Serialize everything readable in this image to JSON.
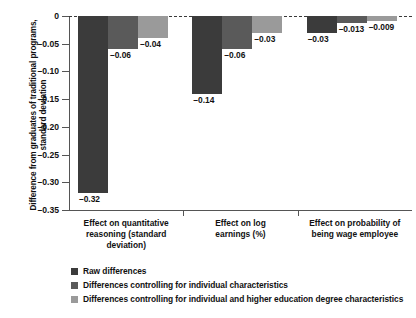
{
  "chart_data": {
    "type": "bar",
    "title": "",
    "xlabel": "",
    "ylabel": "Difference from graduates of traditional programs, standard deviation",
    "ylabel_line1": "Difference from graduates of traditional programs,",
    "ylabel_line2": "standard deviation",
    "ylim": [
      -0.35,
      0
    ],
    "grid": false,
    "legend_position": "bottom-left",
    "y_ticks": [
      "0",
      "–0.05",
      "–0.10",
      "–0.15",
      "–0.20",
      "–0.25",
      "–0.30",
      "–0.35"
    ],
    "y_tick_values": [
      0,
      -0.05,
      -0.1,
      -0.15,
      -0.2,
      -0.25,
      -0.3,
      -0.35
    ],
    "categories": [
      "Effect on quantitative reasoning (standard deviation)",
      "Effect on log earnings (%)",
      "Effect on probability of being wage employee"
    ],
    "category_lines": [
      [
        "Effect on quantitative",
        "reasoning (standard",
        "deviation)"
      ],
      [
        "Effect on log",
        "earnings (%)"
      ],
      [
        "Effect on probability of",
        "being wage employee"
      ]
    ],
    "series": [
      {
        "name": "Raw differences",
        "color": "#3b3b3b",
        "values": [
          -0.32,
          -0.14,
          -0.03
        ],
        "labels": [
          "–0.32",
          "–0.14",
          "–0.03"
        ]
      },
      {
        "name": "Differences controlling for individual characteristics",
        "color": "#5a5a5a",
        "values": [
          -0.06,
          -0.06,
          -0.013
        ],
        "labels": [
          "–0.06",
          "–0.06",
          "–0.013"
        ]
      },
      {
        "name": "Differences controlling for individual and higher education degree characteristics",
        "color": "#9a9a9a",
        "values": [
          -0.04,
          -0.03,
          -0.009
        ],
        "labels": [
          "–0.04",
          "–0.03",
          "–0.009"
        ]
      }
    ]
  },
  "legend": {
    "items": [
      {
        "label": "Raw differences",
        "color": "#3b3b3b"
      },
      {
        "label": "Differences controlling for individual characteristics",
        "color": "#5a5a5a"
      },
      {
        "label": "Differences controlling for individual and higher education degree characteristics",
        "color": "#9a9a9a"
      }
    ]
  }
}
